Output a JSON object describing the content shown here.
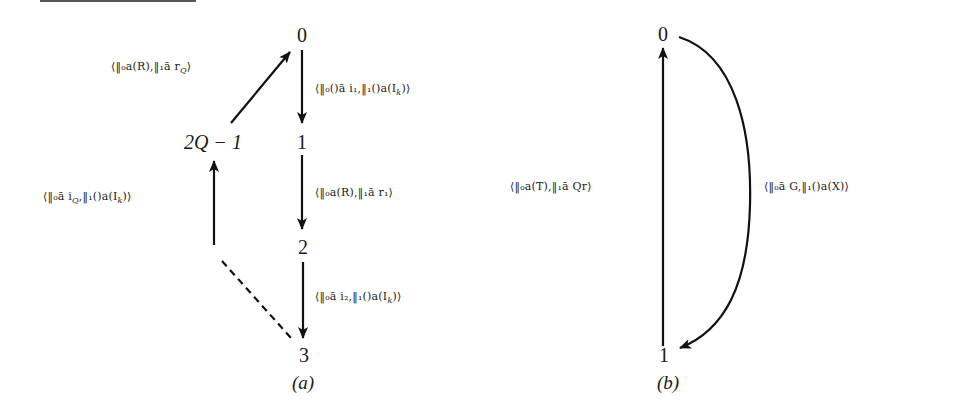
{
  "figure": {
    "diagram_a": {
      "caption": "(a)",
      "nodes": {
        "n0": "0",
        "n1": "1",
        "n2": "2",
        "n3": "3",
        "n2q1": "2Q − 1"
      },
      "edges": [
        {
          "from": "2Q − 1",
          "to": "0",
          "label": "⟨‖₀a(R),‖₁ā r_Q⟩",
          "style": "solid"
        },
        {
          "from": "0",
          "to": "1",
          "label": "⟨‖₀()ā i₁,‖₁()a(I_k)⟩",
          "style": "solid"
        },
        {
          "from": "1",
          "to": "2",
          "label": "⟨‖₀a(R),‖₁ā r₁⟩",
          "style": "solid"
        },
        {
          "from": "2",
          "to": "3",
          "label": "⟨‖₀ā i₂,‖₁()a(I_k)⟩",
          "style": "solid"
        },
        {
          "from": "…",
          "to": "2Q − 1",
          "label": "⟨‖₀ā i_Q,‖₁()a(I_k)⟩",
          "style": "solid"
        },
        {
          "from": "3",
          "to": "…",
          "label": "",
          "style": "dashed"
        }
      ],
      "labels": {
        "e_2q1_0": "⟨‖₀a(R),‖₁ā r",
        "e_2q1_0_sub": "Q",
        "e_0_1": "⟨‖₀()ā i₁,‖₁()a(I",
        "e_0_1_sub": "k",
        "e_1_2": "⟨‖₀a(R),‖₁ā r₁⟩",
        "e_2_3": "⟨‖₀ā i₂,‖₁()a(I",
        "e_2_3_sub": "k",
        "e_up": "⟨‖₀ā i",
        "e_up_sub1": "Q",
        "e_up_mid": ",‖₁()a(I",
        "e_up_sub2": "k",
        "close_paren": ")⟩",
        "close_angle": "⟩"
      }
    },
    "diagram_b": {
      "caption": "(b)",
      "nodes": {
        "n0": "0",
        "n1": "1"
      },
      "edges": [
        {
          "from": "1",
          "to": "0",
          "label": "⟨‖₀a(T),‖₁ā Qr⟩",
          "style": "solid"
        },
        {
          "from": "0",
          "to": "1",
          "label": "⟨‖₀ā G,‖₁()a(X)⟩",
          "style": "curved"
        }
      ],
      "labels": {
        "e_1_0": "⟨‖₀a(T),‖₁ā Qr⟩",
        "e_0_1": "⟨‖₀ā G,‖₁()a(X)⟩"
      }
    }
  }
}
